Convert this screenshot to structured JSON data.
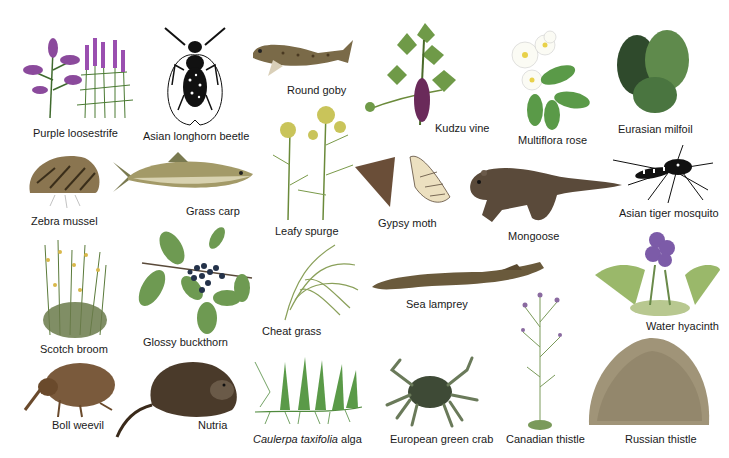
{
  "figure": {
    "type": "species-illustration-collage",
    "background": "#ffffff",
    "species": [
      {
        "id": "purple-loosestrife",
        "label": "Purple loosestrife",
        "kind": "plant",
        "color": "#8b4a9c",
        "label_x": 33,
        "label_y": 127
      },
      {
        "id": "asian-longhorn-beetle",
        "label": "Asian longhorn beetle",
        "kind": "insect",
        "color": "#111111",
        "label_x": 143,
        "label_y": 130
      },
      {
        "id": "round-goby",
        "label": "Round goby",
        "kind": "fish",
        "color": "#6b5a3a",
        "label_x": 287,
        "label_y": 84
      },
      {
        "id": "kudzu-vine",
        "label": "Kudzu vine",
        "kind": "plant",
        "color": "#5e8c3a",
        "label_x": 435,
        "label_y": 122
      },
      {
        "id": "multiflora-rose",
        "label": "Multiflora rose",
        "kind": "plant",
        "color": "#4f8a3c",
        "label_x": 518,
        "label_y": 134
      },
      {
        "id": "eurasian-milfoil",
        "label": "Eurasian milfoil",
        "kind": "plant",
        "color": "#3f6d3a",
        "label_x": 618,
        "label_y": 123
      },
      {
        "id": "zebra-mussel",
        "label": "Zebra mussel",
        "kind": "mollusk",
        "color": "#6e5b3c",
        "label_x": 31,
        "label_y": 215
      },
      {
        "id": "grass-carp",
        "label": "Grass carp",
        "kind": "fish",
        "color": "#8a8250",
        "label_x": 186,
        "label_y": 205
      },
      {
        "id": "leafy-spurge",
        "label": "Leafy spurge",
        "kind": "plant",
        "color": "#b7b34a",
        "label_x": 275,
        "label_y": 225
      },
      {
        "id": "gypsy-moth",
        "label": "Gypsy moth",
        "kind": "insect",
        "color": "#6a4e38",
        "label_x": 378,
        "label_y": 217
      },
      {
        "id": "mongoose",
        "label": "Mongoose",
        "kind": "mammal",
        "color": "#5a4a3a",
        "label_x": 508,
        "label_y": 230
      },
      {
        "id": "asian-tiger-mosquito",
        "label": "Asian tiger mosquito",
        "kind": "insect",
        "color": "#111111",
        "label_x": 619,
        "label_y": 207
      },
      {
        "id": "scotch-broom",
        "label": "Scotch broom",
        "kind": "plant",
        "color": "#c9a83a",
        "label_x": 40,
        "label_y": 343
      },
      {
        "id": "glossy-buckthorn",
        "label": "Glossy buckthorn",
        "kind": "plant",
        "color": "#2f4a6a",
        "label_x": 143,
        "label_y": 336
      },
      {
        "id": "cheat-grass",
        "label": "Cheat grass",
        "kind": "plant",
        "color": "#8aa05a",
        "label_x": 262,
        "label_y": 325
      },
      {
        "id": "sea-lamprey",
        "label": "Sea lamprey",
        "kind": "fish",
        "color": "#5e5238",
        "label_x": 406,
        "label_y": 298
      },
      {
        "id": "water-hyacinth",
        "label": "Water hyacinth",
        "kind": "plant",
        "color": "#7c5ba8",
        "label_x": 646,
        "label_y": 320
      },
      {
        "id": "boll-weevil",
        "label": "Boll weevil",
        "kind": "insect",
        "color": "#7a5a3c",
        "label_x": 52,
        "label_y": 419
      },
      {
        "id": "nutria",
        "label": "Nutria",
        "kind": "mammal",
        "color": "#4a3a2a",
        "label_x": 198,
        "label_y": 419
      },
      {
        "id": "caulerpa-taxifolia-alga",
        "label_italic": "Caulerpa taxifolia",
        "label_rest": " alga",
        "kind": "alga",
        "color": "#4f8a3c",
        "label_x": 253,
        "label_y": 433
      },
      {
        "id": "european-green-crab",
        "label": "European green crab",
        "kind": "crustacean",
        "color": "#3e4a36",
        "label_x": 390,
        "label_y": 433
      },
      {
        "id": "canadian-thistle",
        "label": "Canadian thistle",
        "kind": "plant",
        "color": "#8a6aa0",
        "label_x": 506,
        "label_y": 433
      },
      {
        "id": "russian-thistle",
        "label": "Russian thistle",
        "kind": "plant",
        "color": "#9a8a6a",
        "label_x": 625,
        "label_y": 433
      }
    ]
  }
}
